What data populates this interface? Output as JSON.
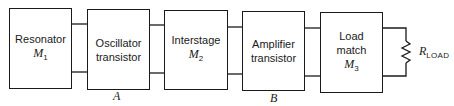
{
  "diagram": {
    "type": "block-diagram",
    "blocks": [
      {
        "id": "resonator",
        "line1": "Resonator",
        "symbol": "M",
        "subscript": "1"
      },
      {
        "id": "oscillator",
        "line1": "Oscillator",
        "line2": "transistor"
      },
      {
        "id": "interstage",
        "line1": "Interstage",
        "symbol": "M",
        "subscript": "2"
      },
      {
        "id": "amplifier",
        "line1": "Amplifier",
        "line2": "transistor"
      },
      {
        "id": "loadmatch",
        "line1": "Load",
        "line2": "match",
        "symbol": "M",
        "subscript": "3"
      }
    ],
    "node_labels": {
      "a": "A",
      "b": "B"
    },
    "load": {
      "symbol": "R",
      "subscript": "LOAD"
    },
    "colors": {
      "line": "#1a1a1a",
      "background": "#ffffff"
    }
  }
}
